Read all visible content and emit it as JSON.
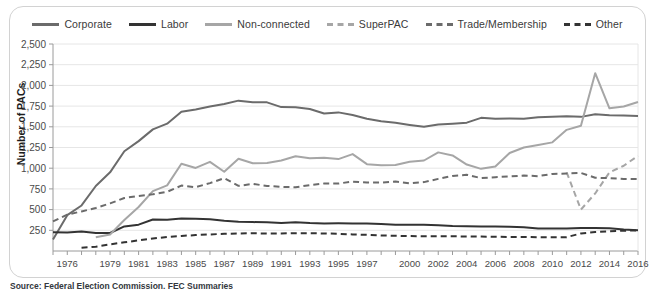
{
  "legend": {
    "position": "top-center",
    "items": [
      {
        "label": "Corporate",
        "color": "#6b6b6b",
        "dash": "solid",
        "width": 3
      },
      {
        "label": "Labor",
        "color": "#333333",
        "dash": "solid",
        "width": 3
      },
      {
        "label": "Non-connected",
        "color": "#a6a6a6",
        "dash": "solid",
        "width": 3
      },
      {
        "label": "SuperPAC",
        "color": "#a6a6a6",
        "dash": "dashed",
        "width": 3
      },
      {
        "label": "Trade/Membership",
        "color": "#6b6b6b",
        "dash": "dashed",
        "width": 3
      },
      {
        "label": "Other",
        "color": "#333333",
        "dash": "dashed",
        "width": 3
      }
    ]
  },
  "source_note": "Source: Federal Election Commission, FEC Summaries",
  "chart_data": {
    "type": "line",
    "title": "",
    "subtitle": "",
    "xlabel": "",
    "ylabel": "Number of PACs",
    "grid": true,
    "legend_position": "top-center",
    "ylim": [
      0,
      2500
    ],
    "yticks": [
      250,
      500,
      750,
      1000,
      1250,
      1500,
      1750,
      2000,
      2250,
      2500
    ],
    "ytick_labels": [
      "250",
      "500",
      "750",
      "1,000",
      "1,250",
      "1,500",
      "1,750",
      "2,000",
      "2,250",
      "2,500"
    ],
    "xlim": [
      1975,
      2016
    ],
    "x": [
      1975,
      1976,
      1977,
      1978,
      1979,
      1980,
      1981,
      1982,
      1983,
      1984,
      1985,
      1986,
      1987,
      1988,
      1989,
      1990,
      1991,
      1992,
      1993,
      1994,
      1995,
      1996,
      1997,
      1998,
      1999,
      2000,
      2001,
      2002,
      2003,
      2004,
      2005,
      2006,
      2007,
      2008,
      2009,
      2010,
      2011,
      2012,
      2013,
      2014,
      2015,
      2016
    ],
    "xtick_labels": [
      "1976",
      "1979",
      "1981",
      "1983",
      "1985",
      "1987",
      "1989",
      "1991",
      "1993",
      "1995",
      "1997",
      "2000",
      "2002",
      "2004",
      "2006",
      "2008",
      "2010",
      "2012",
      "2014",
      "2016"
    ],
    "xtick_values": [
      1976,
      1979,
      1981,
      1983,
      1985,
      1987,
      1989,
      1991,
      1993,
      1995,
      1997,
      2000,
      2002,
      2004,
      2006,
      2008,
      2010,
      2012,
      2014,
      2016
    ],
    "series": [
      {
        "name": "Corporate",
        "color": "#6b6b6b",
        "dash": "solid",
        "x": [
          1975,
          1976,
          1977,
          1978,
          1979,
          1980,
          1981,
          1982,
          1983,
          1984,
          1985,
          1986,
          1987,
          1988,
          1989,
          1990,
          1991,
          1992,
          1993,
          1994,
          1995,
          1996,
          1997,
          1998,
          1999,
          2000,
          2001,
          2002,
          2003,
          2004,
          2005,
          2006,
          2007,
          2008,
          2009,
          2010,
          2011,
          2012,
          2013,
          2014,
          2015,
          2016
        ],
        "values": [
          139,
          433,
          550,
          785,
          950,
          1204,
          1327,
          1469,
          1538,
          1682,
          1710,
          1744,
          1775,
          1816,
          1796,
          1795,
          1738,
          1735,
          1715,
          1660,
          1674,
          1642,
          1597,
          1567,
          1548,
          1523,
          1500,
          1527,
          1538,
          1550,
          1608,
          1596,
          1600,
          1598,
          1614,
          1620,
          1628,
          1620,
          1652,
          1640,
          1635,
          1630
        ]
      },
      {
        "name": "Labor",
        "color": "#333333",
        "dash": "solid",
        "x": [
          1975,
          1976,
          1977,
          1978,
          1979,
          1980,
          1981,
          1982,
          1983,
          1984,
          1985,
          1986,
          1987,
          1988,
          1989,
          1990,
          1991,
          1992,
          1993,
          1994,
          1995,
          1996,
          1997,
          1998,
          1999,
          2000,
          2001,
          2002,
          2003,
          2004,
          2005,
          2006,
          2007,
          2008,
          2009,
          2010,
          2011,
          2012,
          2013,
          2014,
          2015,
          2016
        ],
        "values": [
          226,
          224,
          234,
          217,
          217,
          297,
          318,
          380,
          378,
          394,
          388,
          384,
          364,
          354,
          349,
          346,
          338,
          347,
          337,
          333,
          334,
          332,
          332,
          326,
          318,
          316,
          317,
          310,
          302,
          300,
          297,
          297,
          293,
          287,
          272,
          272,
          272,
          277,
          279,
          275,
          260,
          250
        ]
      },
      {
        "name": "Non-connected",
        "color": "#a6a6a6",
        "dash": "solid",
        "x": [
          1978,
          1979,
          1980,
          1981,
          1982,
          1983,
          1984,
          1985,
          1986,
          1987,
          1988,
          1989,
          1990,
          1991,
          1992,
          1993,
          1994,
          1995,
          1996,
          1997,
          1998,
          1999,
          2000,
          2001,
          2002,
          2003,
          2004,
          2005,
          2006,
          2007,
          2008,
          2009,
          2010,
          2011,
          2012,
          2013,
          2014,
          2015,
          2016
        ],
        "values": [
          165,
          200,
          374,
          531,
          723,
          793,
          1053,
          1003,
          1077,
          957,
          1115,
          1060,
          1062,
          1093,
          1145,
          1121,
          1125,
          1110,
          1170,
          1049,
          1035,
          1038,
          1077,
          1093,
          1191,
          1154,
          1044,
          992,
          1020,
          1183,
          1250,
          1280,
          1312,
          1463,
          1513,
          2148,
          1723,
          1745,
          1800
        ]
      },
      {
        "name": "SuperPAC",
        "color": "#a6a6a6",
        "dash": "dashed",
        "x": [
          2011,
          2012,
          2013,
          2014,
          2015,
          2016
        ],
        "values": [
          950,
          500,
          695,
          950,
          1030,
          1150
        ]
      },
      {
        "name": "Trade/Membership",
        "color": "#6b6b6b",
        "dash": "dashed",
        "x": [
          1975,
          1976,
          1977,
          1978,
          1979,
          1980,
          1981,
          1982,
          1983,
          1984,
          1985,
          1986,
          1987,
          1988,
          1989,
          1990,
          1991,
          1992,
          1993,
          1994,
          1995,
          1996,
          1997,
          1998,
          1999,
          2000,
          2001,
          2002,
          2003,
          2004,
          2005,
          2006,
          2007,
          2008,
          2009,
          2010,
          2011,
          2012,
          2013,
          2014,
          2015,
          2016
        ],
        "values": [
          357,
          440,
          478,
          520,
          575,
          640,
          665,
          685,
          715,
          790,
          770,
          820,
          880,
          787,
          810,
          786,
          774,
          770,
          795,
          815,
          815,
          838,
          826,
          826,
          840,
          817,
          832,
          871,
          907,
          920,
          880,
          892,
          900,
          912,
          904,
          931,
          936,
          942,
          885,
          880,
          870,
          870
        ]
      },
      {
        "name": "Other",
        "color": "#333333",
        "dash": "dashed",
        "x": [
          1977,
          1978,
          1979,
          1980,
          1981,
          1982,
          1983,
          1984,
          1985,
          1986,
          1987,
          1988,
          1989,
          1990,
          1991,
          1992,
          1993,
          1994,
          1995,
          1996,
          1997,
          1998,
          1999,
          2000,
          2001,
          2002,
          2003,
          2004,
          2005,
          2006,
          2007,
          2008,
          2009,
          2010,
          2011,
          2012,
          2013,
          2014,
          2015,
          2016
        ],
        "values": [
          40,
          52,
          80,
          105,
          128,
          150,
          170,
          182,
          192,
          200,
          208,
          212,
          214,
          212,
          212,
          215,
          214,
          212,
          208,
          200,
          196,
          188,
          184,
          180,
          178,
          178,
          177,
          176,
          174,
          172,
          170,
          170,
          167,
          166,
          167,
          212,
          230,
          238,
          245,
          248
        ]
      }
    ]
  }
}
